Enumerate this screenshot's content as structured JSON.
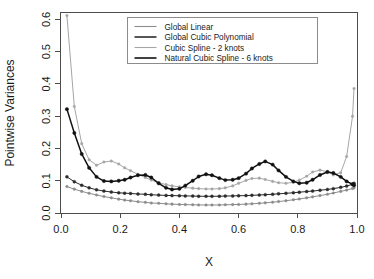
{
  "figure": {
    "name": "pointwise-variance-curves"
  },
  "chart_data": {
    "type": "line",
    "title": "",
    "xlabel": "X",
    "ylabel": "Pointwise Variances",
    "xlim": [
      0.0,
      1.0
    ],
    "ylim": [
      0.0,
      0.62
    ],
    "grid": false,
    "legend_position": "top-center",
    "x_ticks": [
      "0.0",
      "0.2",
      "0.4",
      "0.6",
      "0.8",
      "1.0"
    ],
    "x_tick_values": [
      0.0,
      0.2,
      0.4,
      0.6,
      0.8,
      1.0
    ],
    "y_ticks": [
      "0.0",
      "0.1",
      "0.2",
      "0.3",
      "0.4",
      "0.5",
      "0.6"
    ],
    "y_tick_values": [
      0.0,
      0.1,
      0.2,
      0.3,
      0.4,
      0.5,
      0.6
    ],
    "x": [
      0.02,
      0.045,
      0.07,
      0.095,
      0.12,
      0.145,
      0.17,
      0.195,
      0.215,
      0.235,
      0.26,
      0.285,
      0.305,
      0.33,
      0.355,
      0.375,
      0.4,
      0.42,
      0.445,
      0.465,
      0.49,
      0.51,
      0.535,
      0.555,
      0.58,
      0.6,
      0.625,
      0.645,
      0.67,
      0.69,
      0.715,
      0.735,
      0.76,
      0.785,
      0.805,
      0.83,
      0.85,
      0.875,
      0.9,
      0.92,
      0.945,
      0.965,
      0.985,
      0.99
    ],
    "series": [
      {
        "name": "Global Linear",
        "color": "#8c8c8c",
        "values": [
          0.082,
          0.074,
          0.067,
          0.061,
          0.056,
          0.051,
          0.047,
          0.043,
          0.04,
          0.038,
          0.035,
          0.033,
          0.031,
          0.03,
          0.0285,
          0.0275,
          0.0265,
          0.026,
          0.0255,
          0.025,
          0.0248,
          0.0248,
          0.025,
          0.0255,
          0.026,
          0.0265,
          0.0275,
          0.0285,
          0.03,
          0.0315,
          0.0335,
          0.0355,
          0.038,
          0.041,
          0.0435,
          0.047,
          0.05,
          0.054,
          0.058,
          0.062,
          0.067,
          0.071,
          0.076,
          0.078
        ]
      },
      {
        "name": "Global Cubic Polynomial",
        "color": "#2b2b2b",
        "values": [
          0.112,
          0.097,
          0.086,
          0.078,
          0.072,
          0.068,
          0.065,
          0.0625,
          0.0615,
          0.0605,
          0.059,
          0.058,
          0.0565,
          0.0555,
          0.0545,
          0.054,
          0.0535,
          0.053,
          0.0525,
          0.052,
          0.0518,
          0.0518,
          0.052,
          0.0525,
          0.053,
          0.0535,
          0.054,
          0.0548,
          0.0558,
          0.0568,
          0.058,
          0.0595,
          0.061,
          0.0628,
          0.0645,
          0.0665,
          0.068,
          0.0705,
          0.073,
          0.0755,
          0.0795,
          0.0835,
          0.089,
          0.092
        ]
      },
      {
        "name": "Cubic Spline - 2 knots",
        "color": "#a6a6a6",
        "values": [
          0.612,
          0.33,
          0.215,
          0.165,
          0.148,
          0.158,
          0.161,
          0.152,
          0.14,
          0.131,
          0.12,
          0.11,
          0.102,
          0.094,
          0.088,
          0.084,
          0.081,
          0.079,
          0.077,
          0.0755,
          0.0745,
          0.0745,
          0.0755,
          0.078,
          0.084,
          0.092,
          0.101,
          0.107,
          0.108,
          0.104,
          0.098,
          0.094,
          0.092,
          0.095,
          0.102,
          0.114,
          0.127,
          0.133,
          0.128,
          0.118,
          0.125,
          0.175,
          0.3,
          0.386
        ]
      },
      {
        "name": "Natural Cubic Spline - 6 knots",
        "color": "#111111",
        "values": [
          0.322,
          0.248,
          0.183,
          0.14,
          0.112,
          0.099,
          0.098,
          0.1,
          0.103,
          0.11,
          0.117,
          0.118,
          0.11,
          0.092,
          0.078,
          0.073,
          0.075,
          0.085,
          0.1,
          0.113,
          0.12,
          0.117,
          0.108,
          0.102,
          0.103,
          0.108,
          0.122,
          0.138,
          0.152,
          0.16,
          0.15,
          0.132,
          0.112,
          0.098,
          0.092,
          0.094,
          0.103,
          0.118,
          0.127,
          0.124,
          0.112,
          0.098,
          0.089,
          0.086
        ]
      }
    ]
  },
  "legend": {
    "entries": [
      {
        "label": "Global Linear",
        "color": "#8c8c8c"
      },
      {
        "label": "Global Cubic Polynomial",
        "color": "#2b2b2b"
      },
      {
        "label": "Cubic Spline - 2 knots",
        "color": "#a6a6a6"
      },
      {
        "label": "Natural Cubic Spline - 6 knots",
        "color": "#111111"
      }
    ]
  }
}
